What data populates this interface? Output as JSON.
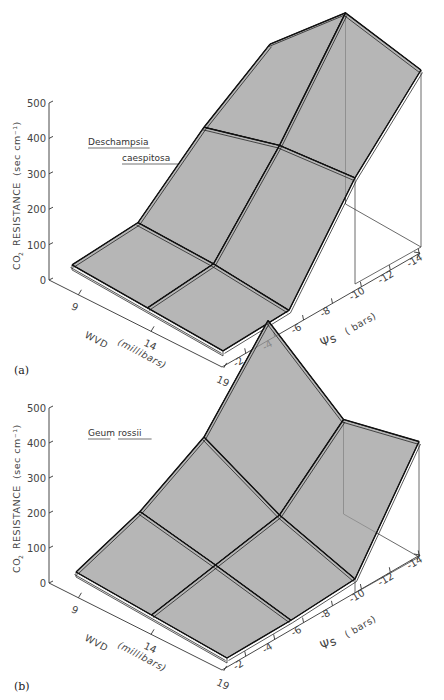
{
  "chart_data": [
    {
      "type": "surface3d",
      "panel_label": "(a)",
      "title": "Deschampsia caespitosa",
      "title_lines": [
        "Deschampsia",
        "caespitosa"
      ],
      "zlabel": "CO2 RESISTANCE (sec cm-1)",
      "zlabel_main": "RESISTANCE",
      "zlabel_co2": "CO",
      "zlabel_units": "(sec  cm⁻¹)",
      "xlabel": "WVD",
      "xlabel_units": "(millibars)",
      "ylabel": "Ψs",
      "ylabel_units": "( bars)",
      "zlim": [
        0,
        500
      ],
      "z_ticks": [
        "0",
        "100",
        "200",
        "300",
        "400",
        "500"
      ],
      "x_ticks": [
        "9",
        "14",
        "19"
      ],
      "y_ticks": [
        "-2",
        "-4",
        "-6",
        "-8",
        "-10",
        "-12",
        "-14"
      ],
      "wvd": [
        9,
        14,
        19
      ],
      "psi_s": [
        -2,
        -6,
        -10,
        -14
      ],
      "z": [
        [
          20,
          35,
          200,
          330
        ],
        [
          20,
          40,
          270,
          540
        ],
        [
          20,
          30,
          300,
          500
        ]
      ]
    },
    {
      "type": "surface3d",
      "panel_label": "(b)",
      "title": "Geum rossii",
      "title_lines": [
        "Geum",
        "rossii"
      ],
      "zlabel": "CO2 RESISTANCE (sec cm-1)",
      "zlabel_main": "RESISTANCE",
      "zlabel_co2": "CO",
      "zlabel_units": "(sec  cm⁻¹)",
      "xlabel": "WVD",
      "xlabel_units": "(millibars)",
      "ylabel": "Ψs",
      "ylabel_units": "( bars)",
      "zlim": [
        0,
        500
      ],
      "z_ticks": [
        "0",
        "100",
        "200",
        "300",
        "400",
        "500"
      ],
      "x_ticks": [
        "9",
        "14",
        "19"
      ],
      "y_ticks": [
        "-2",
        "-4",
        "-6",
        "-8",
        "-10",
        "-12",
        "-14"
      ],
      "wvd": [
        9,
        14,
        19
      ],
      "psi_s": [
        -2,
        -6,
        -10,
        -14
      ],
      "z": [
        [
          20,
          90,
          200,
          430
        ],
        [
          20,
          60,
          100,
          270
        ],
        [
          20,
          25,
          40,
          330
        ]
      ]
    }
  ]
}
